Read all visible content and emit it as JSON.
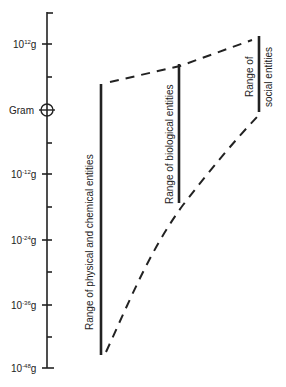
{
  "axis": {
    "ticks": [
      {
        "base": "10",
        "exp": "12",
        "unit": "g",
        "y": 44
      },
      {
        "label": "Gram",
        "y": 110
      },
      {
        "base": "10",
        "exp": "-12",
        "unit": "g",
        "y": 174
      },
      {
        "base": "10",
        "exp": "-24",
        "unit": "g",
        "y": 240
      },
      {
        "base": "10",
        "exp": "-36",
        "unit": "g",
        "y": 305
      },
      {
        "base": "10",
        "exp": "-48",
        "unit": "g",
        "y": 368
      }
    ]
  },
  "ranges": [
    {
      "label": "Range of physical and chemical entities",
      "x": 101,
      "y1": 84,
      "y2": 355
    },
    {
      "label": "Range of biological entities",
      "x": 179,
      "y1": 64,
      "y2": 203
    },
    {
      "label1": "Range of",
      "label2": "social entities",
      "x": 259,
      "y1": 36,
      "y2": 112
    }
  ],
  "colors": {
    "ink": "#222222"
  }
}
